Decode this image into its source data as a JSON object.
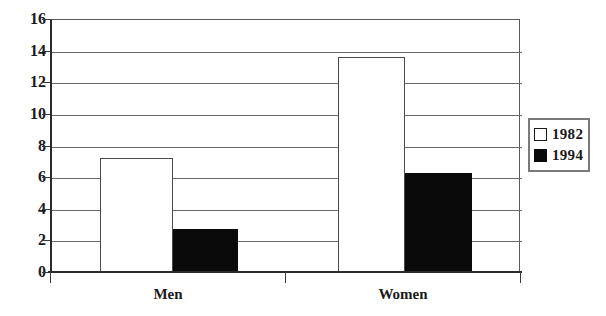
{
  "chart_data": {
    "type": "bar",
    "title": "",
    "subtitle": "",
    "xlabel": "",
    "ylabel": "",
    "categories": [
      "Men",
      "Women"
    ],
    "series": [
      {
        "name": "1982",
        "values": [
          7.2,
          13.6
        ],
        "color": "#ffffff",
        "swatch": "light"
      },
      {
        "name": "1994",
        "values": [
          2.7,
          6.25
        ],
        "color": "#000000",
        "swatch": "dark"
      }
    ],
    "ylim": [
      0,
      16
    ],
    "ytick_values": [
      0,
      2,
      4,
      6,
      8,
      10,
      12,
      14,
      16
    ],
    "ytick_labels": [
      "0",
      "2",
      "4",
      "6",
      "8",
      "10",
      "12",
      "14",
      "16"
    ],
    "grid": true,
    "grid_axis": "y",
    "legend_position": "right"
  },
  "axis": {
    "y_labels": [
      "16",
      "14",
      "12",
      "10",
      "8",
      "6",
      "4",
      "2",
      "0"
    ],
    "x_labels": [
      "Men",
      "Women"
    ]
  },
  "legend": {
    "entries": [
      {
        "label": "1982",
        "swatch": "white-square-icon"
      },
      {
        "label": "1994",
        "swatch": "black-square-icon"
      }
    ]
  }
}
